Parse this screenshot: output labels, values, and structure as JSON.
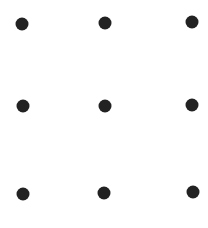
{
  "diagram": {
    "type": "dot-grid",
    "rows": 3,
    "cols": 3,
    "background": "#ffffff",
    "dot_color": "#222222",
    "dot_radius": 6.5,
    "dots": [
      {
        "row": 0,
        "col": 0,
        "x": 22,
        "y": 24
      },
      {
        "row": 0,
        "col": 1,
        "x": 105,
        "y": 23
      },
      {
        "row": 0,
        "col": 2,
        "x": 192,
        "y": 22
      },
      {
        "row": 1,
        "col": 0,
        "x": 23,
        "y": 106
      },
      {
        "row": 1,
        "col": 1,
        "x": 105,
        "y": 106
      },
      {
        "row": 1,
        "col": 2,
        "x": 192,
        "y": 105
      },
      {
        "row": 2,
        "col": 0,
        "x": 23,
        "y": 194
      },
      {
        "row": 2,
        "col": 1,
        "x": 104,
        "y": 193
      },
      {
        "row": 2,
        "col": 2,
        "x": 193,
        "y": 192
      }
    ]
  }
}
